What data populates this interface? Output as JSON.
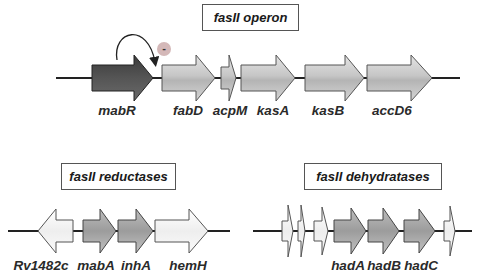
{
  "panels": {
    "operon": {
      "title": "fasII operon",
      "genes": [
        {
          "name": "mabR",
          "style": "dark"
        },
        {
          "name": "fabD",
          "style": "light"
        },
        {
          "name": "acpM",
          "style": "light"
        },
        {
          "name": "kasA",
          "style": "light"
        },
        {
          "name": "kasB",
          "style": "light"
        },
        {
          "name": "accD6",
          "style": "light"
        }
      ],
      "regulation": {
        "from": "mabR",
        "effect": "-",
        "target": "fasII operon promoter"
      }
    },
    "reductases": {
      "title": "fasII reductases",
      "genes": [
        {
          "name": "Rv1482c",
          "style": "white",
          "direction": "reverse"
        },
        {
          "name": "mabA",
          "style": "medium"
        },
        {
          "name": "inhA",
          "style": "medium"
        },
        {
          "name": "hemH",
          "style": "white"
        }
      ]
    },
    "dehydratases": {
      "title": "fasII dehydratases",
      "genes": [
        {
          "name": "",
          "style": "white"
        },
        {
          "name": "",
          "style": "white"
        },
        {
          "name": "",
          "style": "white"
        },
        {
          "name": "hadA",
          "style": "medium"
        },
        {
          "name": "hadB",
          "style": "medium"
        },
        {
          "name": "hadC",
          "style": "medium"
        },
        {
          "name": "",
          "style": "white"
        }
      ]
    }
  },
  "colors": {
    "dark_gene": "#4a4a4a",
    "light_gene": "#c8c8c8",
    "medium_gene": "#a8a8a8",
    "white_gene": "#f4f4f4",
    "inhibition_circle": "#d4b8b8"
  }
}
